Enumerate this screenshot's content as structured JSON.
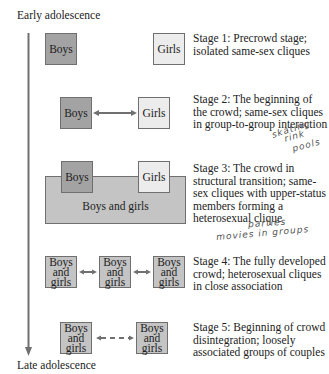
{
  "axis": {
    "top_label": "Early adolescence",
    "bottom_label": "Late adolescence"
  },
  "colors": {
    "boys_fill": "#a3a3a3",
    "girls_fill": "#ececec",
    "mixed_fill": "#c4c4c4",
    "border": "#6f6f6f",
    "arrow": "#707070"
  },
  "stages": [
    {
      "description": "Stage 1: Precrowd stage; isolated same-sex cliques",
      "boxes": [
        "Boys",
        "Girls"
      ]
    },
    {
      "description": "Stage 2: The beginning of the crowd; same-sex cliques in group-to-group interaction",
      "boxes": [
        "Boys",
        "Girls"
      ],
      "annotation": [
        "skating",
        "rink",
        "pools"
      ]
    },
    {
      "description": "Stage 3: The crowd in structural transition; same-sex cliques with upper-status members forming a heterosexual clique",
      "boxes": [
        "Boys",
        "Girls",
        "Boys and girls"
      ],
      "annotation": [
        "parties",
        "movies in groups"
      ]
    },
    {
      "description": "Stage 4: The fully developed crowd; heterosexual cliques in close association",
      "boxes": [
        "Boys and girls",
        "Boys and girls",
        "Boys and girls"
      ]
    },
    {
      "description": "Stage 5: Beginning of crowd disintegration; loosely associated groups of couples",
      "boxes": [
        "Boys and girls",
        "Boys and girls"
      ]
    }
  ]
}
